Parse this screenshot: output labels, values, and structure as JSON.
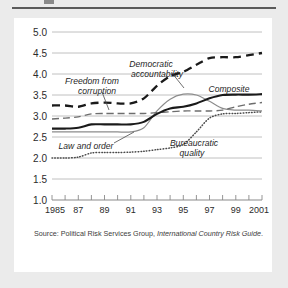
{
  "figure": {
    "source_prefix": "Source: Political Risk Services Group,",
    "source_italic": "International Country Risk Guide",
    "source_suffix": "."
  },
  "chart_data": {
    "type": "line",
    "title": "",
    "xlabel": "",
    "ylabel": "",
    "xlim": [
      1985,
      2001
    ],
    "ylim": [
      1.0,
      5.0
    ],
    "grid": true,
    "legend_position": "inline-annotations",
    "x": [
      1985,
      1986,
      1987,
      1988,
      1989,
      1990,
      1991,
      1992,
      1993,
      1994,
      1995,
      1996,
      1997,
      1998,
      1999,
      2000,
      2001
    ],
    "ytick_labels": [
      "1.0",
      "1.5",
      "2.0",
      "2.5",
      "3.0",
      "3.5",
      "4.0",
      "4.5",
      "5.0"
    ],
    "ytick_values": [
      1.0,
      1.5,
      2.0,
      2.5,
      3.0,
      3.5,
      4.0,
      4.5,
      5.0
    ],
    "xtick_labels": [
      "1985",
      "87",
      "89",
      "91",
      "93",
      "95",
      "97",
      "99",
      "2001"
    ],
    "xtick_values": [
      1985,
      1987,
      1989,
      1991,
      1993,
      1995,
      1997,
      1999,
      2001
    ],
    "series": [
      {
        "name": "Democratic accountability",
        "style": "bold-dashed",
        "color": "#1a1a1a",
        "values": [
          3.25,
          3.25,
          3.22,
          3.3,
          3.32,
          3.3,
          3.3,
          3.42,
          3.72,
          3.95,
          4.05,
          4.22,
          4.38,
          4.4,
          4.4,
          4.45,
          4.5
        ]
      },
      {
        "name": "Freedom from corruption",
        "style": "thin-dashed",
        "color": "#6d6d6d",
        "values": [
          2.93,
          2.95,
          2.98,
          3.05,
          3.06,
          3.06,
          3.06,
          3.06,
          3.08,
          3.1,
          3.12,
          3.12,
          3.12,
          3.14,
          3.22,
          3.28,
          3.32
        ]
      },
      {
        "name": "Composite",
        "style": "bold-solid",
        "color": "#1a1a1a",
        "values": [
          2.7,
          2.7,
          2.72,
          2.8,
          2.8,
          2.8,
          2.8,
          2.86,
          3.05,
          3.18,
          3.22,
          3.3,
          3.42,
          3.5,
          3.51,
          3.51,
          3.52
        ]
      },
      {
        "name": "Law and order",
        "style": "thin-solid",
        "color": "#8c8c8c",
        "values": [
          2.62,
          2.62,
          2.62,
          2.62,
          2.62,
          2.62,
          2.62,
          2.72,
          3.12,
          3.4,
          3.52,
          3.5,
          3.35,
          3.18,
          3.14,
          3.14,
          3.12
        ]
      },
      {
        "name": "Bureaucratic quality",
        "style": "dotted",
        "color": "#4a4a4a",
        "values": [
          2.0,
          2.0,
          2.02,
          2.12,
          2.13,
          2.13,
          2.14,
          2.16,
          2.2,
          2.24,
          2.32,
          2.62,
          2.95,
          3.05,
          3.06,
          3.08,
          3.1
        ]
      }
    ],
    "annotations": [
      {
        "label_line1": "Democratic",
        "label_line2": "accountability"
      },
      {
        "label_line1": "Freedom from",
        "label_line2": "corruption"
      },
      {
        "label_line1": "Composite",
        "label_line2": ""
      },
      {
        "label_line1": "Law and order",
        "label_line2": ""
      },
      {
        "label_line1": "Bureaucratic",
        "label_line2": "quality"
      }
    ]
  }
}
